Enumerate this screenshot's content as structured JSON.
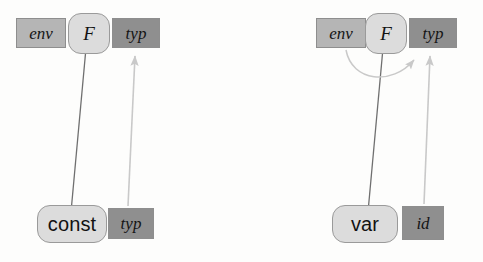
{
  "figure": {
    "background_color": "#fdfdfc"
  },
  "palette": {
    "attr_light_fill": "#b5b5b5",
    "attr_dark_fill": "#8f8f8f",
    "symbol_fill": "#dcdcdc",
    "symbol_stroke": "#9a9a9a",
    "solid_edge_color": "#6f6f6f",
    "dashed_edge_color": "#c9c9c9",
    "text_color": "#141414"
  },
  "diagrams": [
    {
      "id": "const-diagram",
      "nodes": {
        "top_env": {
          "label": "env",
          "kind": "attribute",
          "shade": "light"
        },
        "top_symbol": {
          "label": "F",
          "kind": "symbol",
          "style": "italic"
        },
        "top_typ": {
          "label": "typ",
          "kind": "attribute",
          "shade": "dark"
        },
        "bottom_symbol": {
          "label": "const",
          "kind": "symbol",
          "style": "plain"
        },
        "bottom_typ": {
          "label": "typ",
          "kind": "attribute",
          "shade": "dark"
        }
      },
      "edges": [
        {
          "from": "top_symbol",
          "to": "bottom_symbol",
          "style": "solid",
          "arrow": false
        },
        {
          "from": "bottom_typ",
          "to": "top_typ",
          "style": "dashed",
          "arrow": true
        }
      ]
    },
    {
      "id": "var-diagram",
      "nodes": {
        "top_env": {
          "label": "env",
          "kind": "attribute",
          "shade": "light"
        },
        "top_symbol": {
          "label": "F",
          "kind": "symbol",
          "style": "italic"
        },
        "top_typ": {
          "label": "typ",
          "kind": "attribute",
          "shade": "dark"
        },
        "bottom_symbol": {
          "label": "var",
          "kind": "symbol",
          "style": "plain"
        },
        "bottom_id": {
          "label": "id",
          "kind": "attribute",
          "shade": "dark"
        }
      },
      "edges": [
        {
          "from": "top_symbol",
          "to": "bottom_symbol",
          "style": "solid",
          "arrow": false
        },
        {
          "from": "top_env",
          "to": "top_typ",
          "style": "dashed",
          "arrow": true,
          "shape": "arc"
        },
        {
          "from": "bottom_id",
          "to": "top_typ",
          "style": "dashed",
          "arrow": true
        }
      ]
    }
  ]
}
